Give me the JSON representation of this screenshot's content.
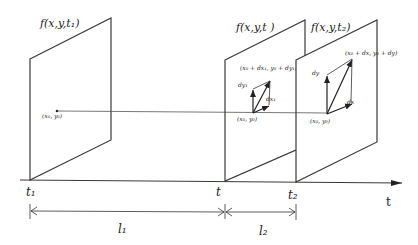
{
  "diagram": {
    "frames": [
      {
        "label": "f(x,y,t₁)",
        "time": "t₁"
      },
      {
        "label": "f(x,y,t )",
        "time": "t"
      },
      {
        "label": "f(x,y,t₂)",
        "time": "t₂"
      }
    ],
    "frame1_point_label": "(x₀, y₀)",
    "frame2": {
      "origin_label": "(x₀, y₀)",
      "target_label": "(x₀ + dx₁, y₀ + dy₁)",
      "dy_label": "dy₁",
      "dx_label": "dx₁"
    },
    "frame3": {
      "origin_label": "(x₀, y₀)",
      "target_label": "(x₀ + dx, y₀ + dy)",
      "dy_label": "dy",
      "dx_label": "dx"
    },
    "axis_label": "t",
    "intervals": [
      {
        "label": "l₁"
      },
      {
        "label": "l₂"
      }
    ]
  }
}
